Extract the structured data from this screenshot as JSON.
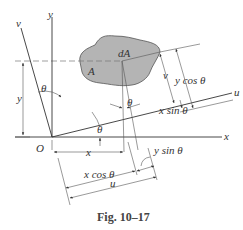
{
  "figure": {
    "caption": "Fig. 10–17",
    "colors": {
      "region_fill": "#b4b4b4",
      "line": "#333333",
      "dash": "#666666"
    }
  },
  "labels": {
    "y_axis": "y",
    "x_axis": "x",
    "v_axis_top": "v",
    "u_axis": "u",
    "origin": "O",
    "region": "A",
    "element": "dA",
    "theta_left": "θ",
    "theta_mid": "θ",
    "theta_origin": "θ",
    "y_dim": "y",
    "x_dim": "x",
    "v_dim": "v",
    "y_cos": "y cos θ",
    "x_sin": "x sin θ",
    "y_sin": "y sin θ",
    "x_cos": "x cos θ",
    "u_dim": "u"
  }
}
